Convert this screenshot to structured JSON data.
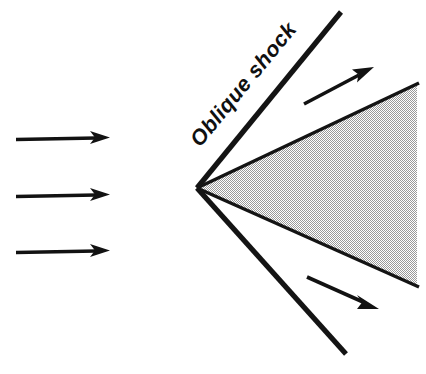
{
  "figure": {
    "background_color": "#ffffff",
    "ink_color": "#141414",
    "shade_color": "#d9d9d9",
    "width": 426,
    "height": 374
  },
  "labels": {
    "oblique_shock": "Oblique shock"
  },
  "geometry": {
    "apex": {
      "x": 197,
      "y": 188
    },
    "upper_shock": {
      "x1": 197,
      "y1": 188,
      "x2": 340,
      "y2": 13
    },
    "lower_shock": {
      "x1": 197,
      "y1": 188,
      "x2": 345,
      "y2": 353
    },
    "wedge_upper_edge": {
      "x1": 197,
      "y1": 188,
      "x2": 417,
      "y2": 84
    },
    "wedge_lower_edge": {
      "x1": 197,
      "y1": 188,
      "x2": 417,
      "y2": 286
    },
    "shock_label_rotation_deg": -50.5,
    "shock_label_anchor": {
      "x": 200,
      "y": 148
    }
  },
  "arrows": {
    "freestream": [
      {
        "name": "freestream-arrow-top",
        "x1": 16,
        "y1": 139,
        "x2": 110,
        "y2": 137
      },
      {
        "name": "freestream-arrow-middle",
        "x1": 16,
        "y1": 196,
        "x2": 110,
        "y2": 194
      },
      {
        "name": "freestream-arrow-bottom",
        "x1": 16,
        "y1": 252,
        "x2": 110,
        "y2": 250
      }
    ],
    "deflected": [
      {
        "name": "deflected-arrow-upper",
        "x1": 304,
        "y1": 104,
        "x2": 372,
        "y2": 68
      },
      {
        "name": "deflected-arrow-lower",
        "x1": 307,
        "y1": 277,
        "x2": 377,
        "y2": 308
      }
    ]
  }
}
